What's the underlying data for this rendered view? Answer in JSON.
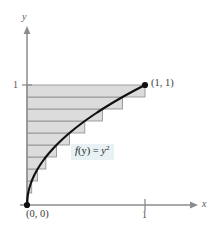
{
  "figure": {
    "background_color": "#ffffff"
  },
  "axes": {
    "x_label": "x",
    "y_label": "y",
    "x_tick_label": "1",
    "y_tick_label": "1",
    "axis_color": "#8c8c8e",
    "origin_px": {
      "x": 27,
      "y": 205
    },
    "unit_px": {
      "x": 145,
      "y": 85
    }
  },
  "annotations": {
    "point_top_right": "(1, 1)",
    "point_origin": "(0, 0)",
    "function_prefix": "f",
    "function_arg": "(y)",
    "function_equals": " = ",
    "function_var": "y",
    "function_exponent": "2",
    "function_full": "f(y) = y²",
    "function_highlight_color": "#e8f2f5"
  },
  "chart_data": {
    "type": "area",
    "xlabel": "x",
    "ylabel": "y",
    "xlim": [
      0,
      1.42
    ],
    "ylim": [
      0,
      1.5
    ],
    "grid": false,
    "legend": null,
    "curve": {
      "name": "x = y^2",
      "color": "#000000",
      "line_width": 2.1,
      "points": [
        {
          "y": 0.0,
          "x": 0.0
        },
        {
          "y": 0.1,
          "x": 0.01
        },
        {
          "y": 0.2,
          "x": 0.04
        },
        {
          "y": 0.3,
          "x": 0.09
        },
        {
          "y": 0.4,
          "x": 0.16
        },
        {
          "y": 0.5,
          "x": 0.25
        },
        {
          "y": 0.6,
          "x": 0.36
        },
        {
          "y": 0.7,
          "x": 0.49
        },
        {
          "y": 0.8,
          "x": 0.64
        },
        {
          "y": 0.9,
          "x": 0.81
        },
        {
          "y": 1.0,
          "x": 1.0
        }
      ]
    },
    "rectangles": {
      "count": 10,
      "orientation": "horizontal",
      "rule": "left-endpoint (inscribed in y, width = y_top^2)",
      "fill_color": "#dcdcdc",
      "stroke_color": "#8a8a8c",
      "strips": [
        {
          "index": 1,
          "y_bottom": 0.0,
          "y_top": 0.1,
          "width": 0.01
        },
        {
          "index": 2,
          "y_bottom": 0.1,
          "y_top": 0.2,
          "width": 0.04
        },
        {
          "index": 3,
          "y_bottom": 0.2,
          "y_top": 0.3,
          "width": 0.09
        },
        {
          "index": 4,
          "y_bottom": 0.3,
          "y_top": 0.4,
          "width": 0.16
        },
        {
          "index": 5,
          "y_bottom": 0.4,
          "y_top": 0.5,
          "width": 0.25
        },
        {
          "index": 6,
          "y_bottom": 0.5,
          "y_top": 0.6,
          "width": 0.36
        },
        {
          "index": 7,
          "y_bottom": 0.6,
          "y_top": 0.7,
          "width": 0.49
        },
        {
          "index": 8,
          "y_bottom": 0.7,
          "y_top": 0.8,
          "width": 0.64
        },
        {
          "index": 9,
          "y_bottom": 0.8,
          "y_top": 0.9,
          "width": 0.81
        },
        {
          "index": 10,
          "y_bottom": 0.9,
          "y_top": 1.0,
          "width": 1.0
        }
      ]
    },
    "markers": [
      {
        "label": "(1, 1)",
        "x": 1.0,
        "y": 1.0,
        "style": "filled-dot"
      },
      {
        "label": "(0, 0)",
        "x": 0.0,
        "y": 0.0,
        "style": "filled-dot"
      }
    ]
  }
}
